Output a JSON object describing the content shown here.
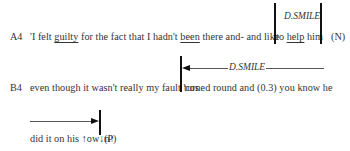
{
  "transcript": {
    "lines": [
      {
        "id": "A4",
        "label": "A4",
        "segments": [
          {
            "text": "'I felt ",
            "underline": false
          },
          {
            "text": "guilty",
            "underline": true
          },
          {
            "text": " for the fact that I hadn't ",
            "underline": false
          },
          {
            "text": "been",
            "underline": true
          },
          {
            "text": " there and- and like",
            "underline": false
          },
          {
            "text": "to ",
            "underline": false
          },
          {
            "text": "help",
            "underline": true
          },
          {
            "text": " him",
            "underline": false
          }
        ],
        "code": "(N)"
      },
      {
        "id": "B4",
        "label": "B4",
        "part1": "even though it wasn't really my fault 'cos",
        "part2": "turned round and (0.3) you know he"
      },
      {
        "id": "B4-cont",
        "text": "did it on his ↑ow↓n↑",
        "code": "(P)"
      }
    ],
    "annotations": [
      {
        "id": "smile-1",
        "label": "D.SMILE",
        "type": "bracketed-span"
      },
      {
        "id": "smile-2",
        "label": "D.SMILE",
        "type": "arrow-left-start"
      },
      {
        "id": "smile-2-end",
        "label": "",
        "type": "arrow-right-end"
      }
    ]
  }
}
